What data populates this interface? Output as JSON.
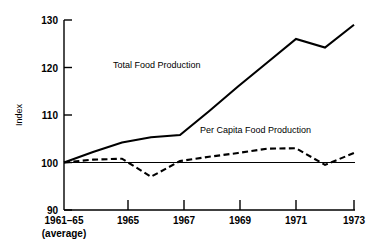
{
  "chart_data": {
    "type": "line",
    "title": "",
    "xlabel": "",
    "ylabel": "Index",
    "ylim": [
      90,
      130
    ],
    "yticks": [
      90,
      100,
      110,
      120,
      130
    ],
    "ytick_labels": [
      "90",
      "100",
      "110",
      "120",
      "130"
    ],
    "xlim": [
      1963,
      1973
    ],
    "xticks": [
      1963,
      1965,
      1967,
      1969,
      1971,
      1973
    ],
    "xtick_labels": [
      "1961–65\n(average)",
      "1965",
      "1967",
      "1969",
      "1971",
      "1973"
    ],
    "xtick_label_base_line1": "1961–65",
    "xtick_label_base_line2": "(average)",
    "grid": false,
    "legend_position": "inline-annotations",
    "reference_line": {
      "value": 100,
      "style": "thin-solid"
    },
    "series": [
      {
        "name": "Total Food Production",
        "style": "solid",
        "label_position": "inline",
        "x": [
          1963,
          1964,
          1965,
          1966,
          1967,
          1968,
          1969,
          1970,
          1971,
          1972,
          1973
        ],
        "values": [
          100,
          102.2,
          104.2,
          105.3,
          105.8,
          110.8,
          116.0,
          121.0,
          126.0,
          124.2,
          129.0
        ]
      },
      {
        "name": "Per Capita Food Production",
        "style": "dashed",
        "label_position": "inline",
        "x": [
          1963,
          1964,
          1965,
          1966,
          1967,
          1968,
          1969,
          1970,
          1971,
          1972,
          1973
        ],
        "values": [
          100,
          100.6,
          100.8,
          97.0,
          100.3,
          101.2,
          102.0,
          102.9,
          103.0,
          99.5,
          102.0
        ]
      }
    ]
  },
  "labels": {
    "y_axis_title": "Index",
    "series_total": "Total Food Production",
    "series_per_capita": "Per Capita Food Production",
    "y_130": "130",
    "y_120": "120",
    "y_110": "110",
    "y_100": "100",
    "y_90": "90",
    "x_base_line1": "1961–65",
    "x_base_line2": "(average)",
    "x_1965": "1965",
    "x_1967": "1967",
    "x_1969": "1969",
    "x_1971": "1971",
    "x_1973": "1973"
  },
  "colors": {
    "ink": "#000000",
    "background": "#ffffff"
  }
}
